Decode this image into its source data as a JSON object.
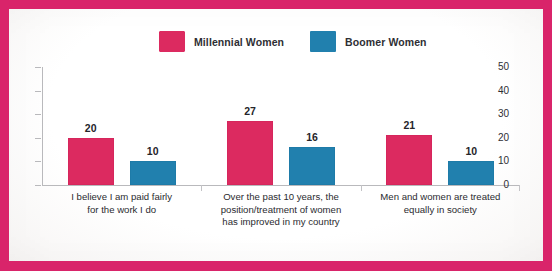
{
  "chart_data": {
    "type": "bar",
    "title": "",
    "subtitle": "",
    "xlabel": "",
    "ylabel": "",
    "ylim": [
      0,
      50
    ],
    "yticks": [
      "0",
      "10",
      "20",
      "30",
      "40",
      "50"
    ],
    "grid": false,
    "legend_position": "top-center",
    "categories": [
      "I believe I am paid fairly for the work I do",
      "Over the past 10 years, the position/treatment of women has improved in my country",
      "Men and women are treated equally in society"
    ],
    "category_lines": [
      [
        "I believe I am paid fairly",
        "for the work I do"
      ],
      [
        "Over the past 10 years, the",
        "position/treatment of women",
        "has improved in my country"
      ],
      [
        "Men and women are treated",
        "equally in society"
      ]
    ],
    "series": [
      {
        "name": "Millennial Women",
        "color": "#dc2a60",
        "values": [
          20,
          27,
          21
        ]
      },
      {
        "name": "Boomer Women",
        "color": "#2180ae",
        "values": [
          10,
          16,
          10
        ]
      }
    ]
  },
  "legend": {
    "entries": [
      {
        "label": "Millennial Women",
        "swatch": "pink-swatch-icon"
      },
      {
        "label": "Boomer Women",
        "swatch": "blue-swatch-icon"
      }
    ]
  },
  "colors": {
    "series_millennial": "#dc2a60",
    "series_boomer": "#2180ae",
    "border_frame": "#d9246a",
    "axis": "#b9b9bc",
    "text": "#2b2b30",
    "paper": "#fdfcfb"
  }
}
